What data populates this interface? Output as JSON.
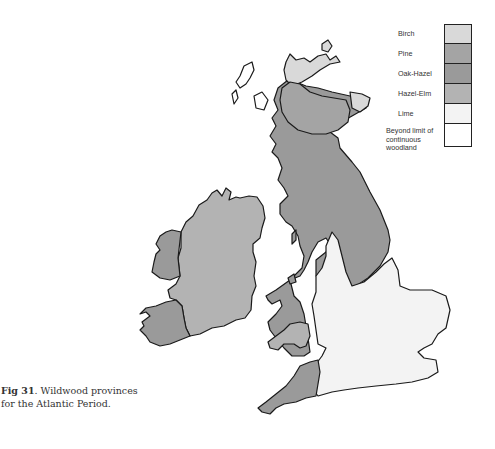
{
  "legend": {
    "items": [
      {
        "label": "Birch",
        "color": "#d9d9d9"
      },
      {
        "label": "Pine",
        "color": "#a4a4a4"
      },
      {
        "label": "Oak-Hazel",
        "color": "#9a9a9a"
      },
      {
        "label": "Hazel-Elm",
        "color": "#b3b3b3"
      },
      {
        "label": "Lime",
        "color": "#f3f3f3"
      },
      {
        "label": "Beyond limit of continuous woodland",
        "color": "#ffffff"
      }
    ]
  },
  "caption": {
    "figure_label": "Fig 31",
    "text": ". Wildwood provinces for the Atlantic Period."
  },
  "map": {
    "regions": [
      {
        "name": "Scotland north (Birch)",
        "province": "Birch"
      },
      {
        "name": "Scottish Highlands (Pine)",
        "province": "Pine"
      },
      {
        "name": "Northern Britain and West (Oak-Hazel)",
        "province": "Oak-Hazel"
      },
      {
        "name": "Ireland (Hazel-Elm)",
        "province": "Hazel-Elm"
      },
      {
        "name": "West Ireland (Oak-Hazel)",
        "province": "Oak-Hazel"
      },
      {
        "name": "South Wales (Hazel-Elm)",
        "province": "Hazel-Elm"
      },
      {
        "name": "Lowland England (Lime)",
        "province": "Lime"
      },
      {
        "name": "Outer Hebrides (Beyond limit)",
        "province": "Beyond limit of continuous woodland"
      }
    ]
  }
}
